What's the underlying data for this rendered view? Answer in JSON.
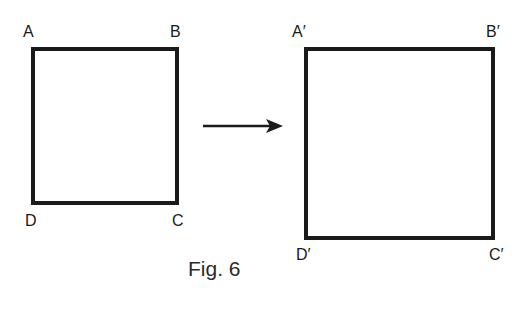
{
  "figure": {
    "caption": "Fig. 6",
    "original_shape": {
      "type": "rectangle",
      "vertices": {
        "top_left": "A",
        "top_right": "B",
        "bottom_right": "C",
        "bottom_left": "D"
      }
    },
    "transformation_arrow": {
      "direction": "right"
    },
    "image_shape": {
      "type": "square",
      "vertices": {
        "top_left": "A′",
        "top_right": "B′",
        "bottom_right": "C′",
        "bottom_left": "D′"
      }
    },
    "colors": {
      "stroke": "#1a1a1a",
      "background": "#ffffff"
    }
  }
}
